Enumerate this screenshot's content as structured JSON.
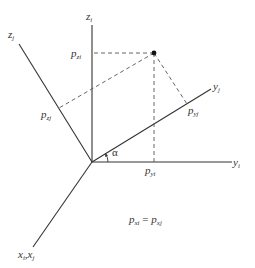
{
  "diagram": {
    "type": "coordinate-frame-rotation",
    "colors": {
      "axis": "#333333",
      "dashed": "#555555",
      "point": "#111111",
      "background": "#ffffff"
    },
    "axes": {
      "zi": {
        "base": "z",
        "sub": "i"
      },
      "zj": {
        "base": "z",
        "sub": "j"
      },
      "yi": {
        "base": "y",
        "sub": "i"
      },
      "yj": {
        "base": "y",
        "sub": "j"
      },
      "x": {
        "base1": "x",
        "sub1": "i",
        "sep": ",",
        "base2": "x",
        "sub2": "j"
      }
    },
    "projections": {
      "pzi": {
        "base": "p",
        "sub": "zi"
      },
      "pzj": {
        "base": "p",
        "sub": "zj"
      },
      "pyi": {
        "base": "p",
        "sub": "yi"
      },
      "pyj": {
        "base": "p",
        "sub": "yj"
      }
    },
    "angle": {
      "symbol": "α"
    },
    "equation": {
      "lhs_base": "p",
      "lhs_sub": "xi",
      "op": " = ",
      "rhs_base": "p",
      "rhs_sub": "xj"
    }
  }
}
